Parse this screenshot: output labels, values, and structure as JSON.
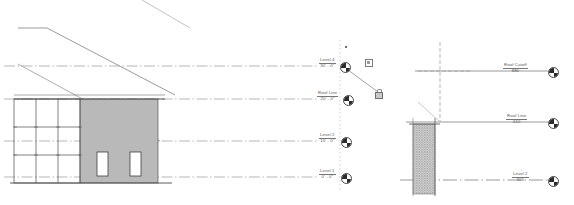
{
  "app": {
    "view_type": "elevation",
    "drawing_title": "Building Elevation with Level Datums"
  },
  "colors": {
    "line": "#4a4a4a",
    "thin_line": "#8a8a8a",
    "datum_line": "#9a9a9a",
    "wall_fill": "#b9b9b9",
    "text": "#555555",
    "white": "#ffffff",
    "bubble_fill": "#2b2b2b",
    "hatch": "#a8a8a8"
  },
  "left_view": {
    "name": "elevation-view",
    "levels": [
      {
        "id": "level-4",
        "label": "Level 4",
        "elevation": "30' - 0\"",
        "y": 66
      },
      {
        "id": "roof-line",
        "label": "Roof Line",
        "elevation": "20' - 0\"",
        "y": 99
      },
      {
        "id": "level-2",
        "label": "Level 2",
        "elevation": "10' - 0\"",
        "y": 141
      },
      {
        "id": "level-1",
        "label": "Level 1",
        "elevation": "0' - 0\"",
        "y": 177
      }
    ],
    "building": {
      "curtain_wall": {
        "name": "curtain-wall-grid",
        "columns": 3,
        "rows": 3
      },
      "solid_wall": {
        "name": "shaded-wall",
        "windows": 2
      }
    },
    "roof_slopes": 2
  },
  "selection_controls": {
    "drag_handle_label": "drag-handle",
    "constraint_label": "padlock-constraint",
    "shape_handle_label": "shape-handle"
  },
  "right_view": {
    "name": "wall-section-view",
    "levels": [
      {
        "id": "roof-cutoff",
        "label": "Roof Cutoff",
        "elevation": "880",
        "y": 71
      },
      {
        "id": "roof-line",
        "label": "Roof Line",
        "elevation": "610",
        "y": 122
      },
      {
        "id": "level-2",
        "label": "Level 2",
        "elevation": "305",
        "y": 180
      }
    ],
    "wall_section": {
      "name": "hatched-wall-section",
      "hatch_pattern": "vertical-stipple"
    }
  }
}
